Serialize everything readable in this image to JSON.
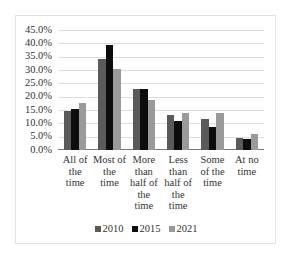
{
  "chart_data": {
    "type": "bar",
    "title": "",
    "xlabel": "",
    "ylabel": "",
    "ylim": [
      0,
      45
    ],
    "yticks": [
      "0.0%",
      "5.0%",
      "10.0%",
      "15.0%",
      "20.0%",
      "25.0%",
      "30.0%",
      "35.0%",
      "40.0%",
      "45.0%"
    ],
    "grid": true,
    "legend_position": "bottom",
    "categories": [
      "All of the time",
      "Most of the time",
      "More than half of the time",
      "Less than half of the time",
      "Some of the time",
      "At no time"
    ],
    "category_lines": [
      [
        "All of",
        "the",
        "time"
      ],
      [
        "Most of",
        "the",
        "time"
      ],
      [
        "More",
        "than",
        "half of",
        "the",
        "time"
      ],
      [
        "Less",
        "than",
        "half of",
        "the",
        "time"
      ],
      [
        "Some",
        "of the",
        "time"
      ],
      [
        "At no",
        "time"
      ]
    ],
    "series": [
      {
        "name": "2010",
        "color": "#5a5a5a",
        "values": [
          14.5,
          34.0,
          23.0,
          13.0,
          11.5,
          4.5
        ]
      },
      {
        "name": "2015",
        "color": "#0d0d0d",
        "values": [
          15.2,
          39.5,
          22.8,
          10.8,
          8.7,
          4.0
        ]
      },
      {
        "name": "2021",
        "color": "#9a9a9a",
        "values": [
          17.5,
          30.5,
          18.8,
          13.8,
          13.8,
          6.0
        ]
      }
    ]
  },
  "legend": {
    "items": [
      {
        "label": "2010",
        "color": "#5a5a5a"
      },
      {
        "label": "2015",
        "color": "#0d0d0d"
      },
      {
        "label": "2021",
        "color": "#9a9a9a"
      }
    ]
  }
}
